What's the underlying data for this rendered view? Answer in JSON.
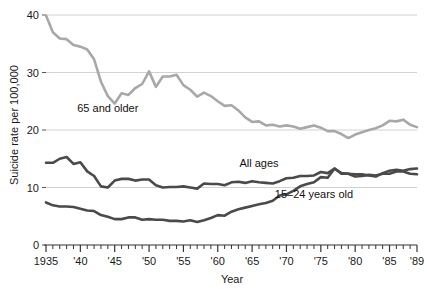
{
  "chart_data": {
    "type": "line",
    "title": "",
    "xlabel": "Year",
    "ylabel": "Suicide rate per 100,000",
    "xlim": [
      1935,
      1989
    ],
    "ylim": [
      0,
      40
    ],
    "yticks": [
      0,
      10,
      20,
      30,
      40
    ],
    "ytick_labels": [
      "0",
      "10",
      "20",
      "30",
      "40"
    ],
    "xticks": [
      1935,
      1940,
      1945,
      1950,
      1955,
      1960,
      1965,
      1970,
      1975,
      1980,
      1985,
      1989
    ],
    "xtick_labels": [
      "1935",
      "'40",
      "'45",
      "'50",
      "'55",
      "'60",
      "'65",
      "'70",
      "'75",
      "'80",
      "'85",
      "'89"
    ],
    "minor_xticks_every": 1,
    "grid": "horizontal-only",
    "legend": "inline-annotations",
    "x": [
      1935,
      1936,
      1937,
      1938,
      1939,
      1940,
      1941,
      1942,
      1943,
      1944,
      1945,
      1946,
      1947,
      1948,
      1949,
      1950,
      1951,
      1952,
      1953,
      1954,
      1955,
      1956,
      1957,
      1958,
      1959,
      1960,
      1961,
      1962,
      1963,
      1964,
      1965,
      1966,
      1967,
      1968,
      1969,
      1970,
      1971,
      1972,
      1973,
      1974,
      1975,
      1976,
      1977,
      1978,
      1979,
      1980,
      1981,
      1982,
      1983,
      1984,
      1985,
      1986,
      1987,
      1988,
      1989
    ],
    "series": [
      {
        "name": "65 and older",
        "color": "#a8a8a8",
        "label_x": 1944,
        "label_y": 23.2,
        "values": [
          39.9,
          37.0,
          35.9,
          35.8,
          34.8,
          34.5,
          34.0,
          32.3,
          28.4,
          25.9,
          24.6,
          26.4,
          26.1,
          27.3,
          28.0,
          30.2,
          27.5,
          29.3,
          29.3,
          29.6,
          27.8,
          27.0,
          25.8,
          26.5,
          25.9,
          25.0,
          24.2,
          24.3,
          23.4,
          22.2,
          21.4,
          21.5,
          20.8,
          20.9,
          20.6,
          20.8,
          20.6,
          20.2,
          20.5,
          20.8,
          20.4,
          19.8,
          19.8,
          19.3,
          18.6,
          19.2,
          19.6,
          20.0,
          20.3,
          20.8,
          21.6,
          21.5,
          21.8,
          20.9,
          20.5
        ]
      },
      {
        "name": "All ages",
        "color": "#4a4a4a",
        "label_x": 1966,
        "label_y": 13.6,
        "values": [
          14.3,
          14.3,
          15.0,
          15.3,
          14.1,
          14.4,
          12.8,
          12.0,
          10.2,
          10.0,
          11.2,
          11.5,
          11.5,
          11.2,
          11.4,
          11.4,
          10.4,
          10.0,
          10.1,
          10.1,
          10.2,
          10.0,
          9.8,
          10.7,
          10.6,
          10.6,
          10.4,
          10.9,
          11.0,
          10.8,
          11.1,
          10.9,
          10.8,
          10.7,
          11.1,
          11.6,
          11.7,
          12.0,
          12.0,
          12.1,
          12.7,
          12.5,
          13.3,
          12.5,
          12.4,
          11.9,
          12.0,
          12.2,
          12.1,
          12.4,
          12.4,
          12.8,
          12.8,
          12.4,
          12.3
        ]
      },
      {
        "name": "15–24 years old",
        "color": "#4a4a4a",
        "label_x": 1974,
        "label_y": 8.2,
        "values": [
          7.4,
          6.9,
          6.7,
          6.7,
          6.6,
          6.3,
          6.0,
          5.9,
          5.2,
          4.9,
          4.5,
          4.5,
          4.8,
          4.8,
          4.4,
          4.5,
          4.4,
          4.4,
          4.2,
          4.2,
          4.1,
          4.3,
          4.0,
          4.3,
          4.7,
          5.2,
          5.1,
          5.8,
          6.2,
          6.5,
          6.8,
          7.1,
          7.3,
          7.7,
          8.6,
          8.8,
          9.4,
          10.2,
          10.6,
          10.9,
          11.8,
          11.7,
          13.3,
          12.4,
          12.4,
          12.3,
          12.3,
          12.1,
          11.9,
          12.5,
          12.9,
          13.1,
          12.9,
          13.2,
          13.3
        ]
      }
    ]
  }
}
